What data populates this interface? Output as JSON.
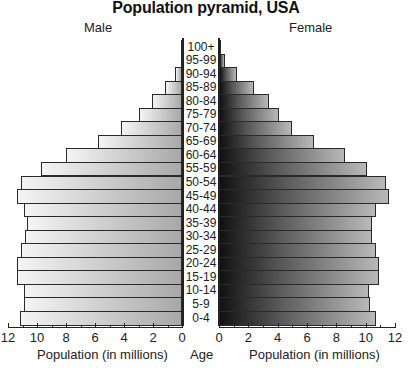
{
  "title": "Population pyramid, USA",
  "labels": {
    "male": "Male",
    "female": "Female",
    "x_axis_left": "Population (in millions)",
    "x_axis_right": "Population (in millions)",
    "age": "Age"
  },
  "chart_data": {
    "type": "bar",
    "orientation": "horizontal",
    "title": "Population pyramid, USA",
    "categories": [
      "100+",
      "95-99",
      "90-94",
      "85-89",
      "80-84",
      "75-79",
      "70-74",
      "65-69",
      "60-64",
      "55-59",
      "50-54",
      "45-49",
      "40-44",
      "35-39",
      "30-34",
      "25-29",
      "20-24",
      "15-19",
      "10-14",
      "5-9",
      "0-4"
    ],
    "series": [
      {
        "name": "Male",
        "values": [
          0.05,
          0.1,
          0.5,
          1.2,
          2.1,
          3.0,
          4.2,
          5.8,
          8.0,
          9.7,
          11.1,
          11.4,
          10.9,
          10.7,
          10.8,
          11.1,
          11.4,
          11.4,
          10.9,
          10.9,
          11.2
        ]
      },
      {
        "name": "Female",
        "values": [
          0.1,
          0.4,
          1.2,
          2.4,
          3.4,
          4.1,
          5.0,
          6.5,
          8.6,
          10.1,
          11.4,
          11.6,
          10.7,
          10.4,
          10.4,
          10.7,
          10.9,
          10.9,
          10.2,
          10.3,
          10.7
        ]
      }
    ],
    "xlabel": "Population (in millions)",
    "ylabel": "Age",
    "xlim": [
      0,
      12
    ],
    "xticks": [
      0,
      2,
      4,
      6,
      8,
      10,
      12
    ],
    "grid": false,
    "legend": {
      "left": "Male",
      "right": "Female",
      "position": "top"
    }
  }
}
